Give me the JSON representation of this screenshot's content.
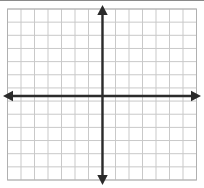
{
  "figure": {
    "type": "coordinate-grid",
    "title": "",
    "background_color": "#ffffff",
    "top_rule_color": "#8a8a8a"
  },
  "chart_data": {
    "type": "scatter",
    "title": "",
    "xlabel": "",
    "ylabel": "",
    "grid": true,
    "legend": null,
    "series": [],
    "x": [],
    "values": [],
    "xlim": [
      -7,
      7
    ],
    "ylim": [
      -6.5,
      6.5
    ],
    "x_tick_labels": [],
    "y_tick_labels": [],
    "annotations": [],
    "grid_columns": 14,
    "grid_rows": 13,
    "grid_spacing_px": 13.5,
    "grid_color": "#c9c9c9",
    "grid_border_color": "#b0b0b0",
    "axis_color": "#2b2b2b",
    "axis_line_width": 2.4,
    "axis_origin": {
      "x": 102.5,
      "y": 96
    },
    "axis_arrows": {
      "up": {
        "x": 102.5,
        "y": 5,
        "label": "y-axis-positive-arrow"
      },
      "down": {
        "x": 102.5,
        "y": 185,
        "label": "y-axis-negative-arrow"
      },
      "left": {
        "x": 3,
        "y": 96,
        "label": "x-axis-negative-arrow"
      },
      "right": {
        "x": 201,
        "y": 96,
        "label": "x-axis-positive-arrow"
      }
    },
    "grid_bounds": {
      "left": 7.5,
      "top": 9,
      "right": 196.5,
      "bottom": 180
    }
  }
}
